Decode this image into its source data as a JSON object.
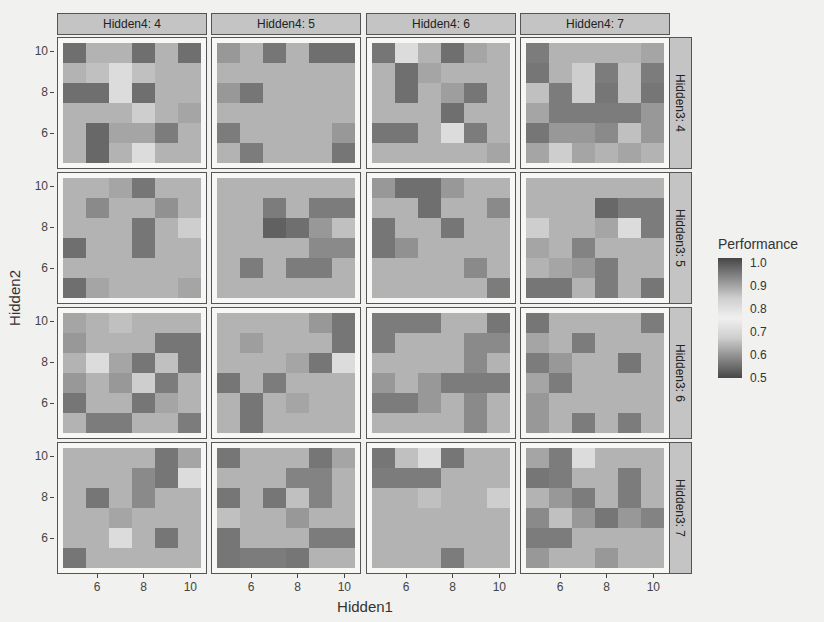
{
  "chart_data": {
    "type": "heatmap",
    "title": "",
    "xlabel": "Hidden1",
    "ylabel": "Hidden2",
    "x_values": [
      5,
      6,
      7,
      8,
      9,
      10
    ],
    "y_values_top_to_bottom": [
      10,
      9,
      8,
      7,
      6,
      5
    ],
    "x_ticks": [
      "6",
      "8",
      "10"
    ],
    "y_ticks": [
      "10",
      "8",
      "6"
    ],
    "facet_cols": {
      "variable": "Hidden4",
      "labels": [
        "Hidden4: 4",
        "Hidden4: 5",
        "Hidden4: 6",
        "Hidden4: 7"
      ]
    },
    "facet_rows": {
      "variable": "Hidden3",
      "labels": [
        "Hidden3: 4",
        "Hidden3: 5",
        "Hidden3: 6",
        "Hidden3: 7"
      ]
    },
    "legend": {
      "title": "Performance",
      "labels": [
        "1.0",
        "0.9",
        "0.8",
        "0.7",
        "0.6",
        "0.5"
      ],
      "range": [
        0.5,
        1.0
      ],
      "colormap": "diverging gray: dark at 0.5 and 1.0, light near 0.75"
    },
    "value_note": "Cell values are approximate, estimated from gray level only. Dark cells are ambiguous between the 0.5 and 1.0 ends of the scale; a mid-value was used.",
    "panels": [
      {
        "row": "Hidden3: 4",
        "col": "Hidden4: 4",
        "values": [
          [
            0.56,
            0.66,
            0.66,
            0.56,
            0.66,
            0.56
          ],
          [
            0.66,
            0.68,
            0.72,
            0.68,
            0.66,
            0.66
          ],
          [
            0.56,
            0.56,
            0.78,
            0.56,
            0.66,
            0.66
          ],
          [
            0.66,
            0.66,
            0.66,
            0.7,
            0.66,
            0.64
          ],
          [
            0.66,
            0.55,
            0.64,
            0.64,
            0.58,
            0.66
          ],
          [
            0.66,
            0.55,
            0.66,
            0.78,
            0.66,
            0.66
          ]
        ]
      },
      {
        "row": "Hidden3: 4",
        "col": "Hidden4: 5",
        "values": [
          [
            0.62,
            0.66,
            0.57,
            0.66,
            0.56,
            0.56
          ],
          [
            0.66,
            0.66,
            0.66,
            0.66,
            0.66,
            0.66
          ],
          [
            0.62,
            0.57,
            0.66,
            0.66,
            0.66,
            0.66
          ],
          [
            0.66,
            0.66,
            0.66,
            0.66,
            0.66,
            0.66
          ],
          [
            0.58,
            0.66,
            0.66,
            0.66,
            0.66,
            0.62
          ],
          [
            0.66,
            0.58,
            0.66,
            0.66,
            0.66,
            0.57
          ]
        ]
      },
      {
        "row": "Hidden3: 4",
        "col": "Hidden4: 6",
        "values": [
          [
            0.57,
            0.78,
            0.66,
            0.56,
            0.64,
            0.66
          ],
          [
            0.66,
            0.56,
            0.64,
            0.66,
            0.66,
            0.66
          ],
          [
            0.66,
            0.56,
            0.66,
            0.63,
            0.57,
            0.66
          ],
          [
            0.66,
            0.66,
            0.66,
            0.56,
            0.66,
            0.66
          ],
          [
            0.57,
            0.57,
            0.66,
            0.78,
            0.58,
            0.66
          ],
          [
            0.66,
            0.66,
            0.66,
            0.66,
            0.66,
            0.64
          ]
        ]
      },
      {
        "row": "Hidden3: 4",
        "col": "Hidden4: 7",
        "values": [
          [
            0.58,
            0.66,
            0.66,
            0.66,
            0.66,
            0.64
          ],
          [
            0.57,
            0.66,
            0.7,
            0.58,
            0.68,
            0.58
          ],
          [
            0.68,
            0.58,
            0.7,
            0.57,
            0.68,
            0.57
          ],
          [
            0.64,
            0.58,
            0.58,
            0.58,
            0.58,
            0.62
          ],
          [
            0.57,
            0.62,
            0.62,
            0.6,
            0.68,
            0.62
          ],
          [
            0.64,
            0.7,
            0.64,
            0.66,
            0.64,
            0.66
          ]
        ]
      },
      {
        "row": "Hidden3: 5",
        "col": "Hidden4: 4",
        "values": [
          [
            0.66,
            0.66,
            0.64,
            0.57,
            0.66,
            0.66
          ],
          [
            0.66,
            0.6,
            0.66,
            0.66,
            0.61,
            0.66
          ],
          [
            0.66,
            0.66,
            0.66,
            0.57,
            0.66,
            0.7
          ],
          [
            0.56,
            0.66,
            0.66,
            0.57,
            0.66,
            0.66
          ],
          [
            0.66,
            0.66,
            0.66,
            0.66,
            0.66,
            0.66
          ],
          [
            0.56,
            0.64,
            0.66,
            0.66,
            0.66,
            0.64
          ]
        ]
      },
      {
        "row": "Hidden3: 5",
        "col": "Hidden4: 5",
        "values": [
          [
            0.66,
            0.66,
            0.66,
            0.66,
            0.66,
            0.66
          ],
          [
            0.66,
            0.66,
            0.58,
            0.66,
            0.58,
            0.58
          ],
          [
            0.66,
            0.66,
            0.54,
            0.56,
            0.62,
            0.68
          ],
          [
            0.66,
            0.66,
            0.66,
            0.66,
            0.6,
            0.6
          ],
          [
            0.66,
            0.58,
            0.66,
            0.58,
            0.58,
            0.66
          ],
          [
            0.66,
            0.66,
            0.66,
            0.66,
            0.66,
            0.66
          ]
        ]
      },
      {
        "row": "Hidden3: 5",
        "col": "Hidden4: 6",
        "values": [
          [
            0.62,
            0.56,
            0.56,
            0.62,
            0.66,
            0.66
          ],
          [
            0.66,
            0.66,
            0.56,
            0.66,
            0.66,
            0.6
          ],
          [
            0.57,
            0.66,
            0.66,
            0.57,
            0.66,
            0.66
          ],
          [
            0.57,
            0.61,
            0.66,
            0.66,
            0.66,
            0.66
          ],
          [
            0.66,
            0.66,
            0.66,
            0.66,
            0.6,
            0.66
          ],
          [
            0.66,
            0.66,
            0.66,
            0.66,
            0.66,
            0.58
          ]
        ]
      },
      {
        "row": "Hidden3: 5",
        "col": "Hidden4: 7",
        "values": [
          [
            0.66,
            0.66,
            0.66,
            0.66,
            0.66,
            0.66
          ],
          [
            0.66,
            0.66,
            0.66,
            0.55,
            0.58,
            0.58
          ],
          [
            0.7,
            0.66,
            0.66,
            0.64,
            0.78,
            0.58
          ],
          [
            0.64,
            0.66,
            0.59,
            0.66,
            0.66,
            0.66
          ],
          [
            0.66,
            0.64,
            0.62,
            0.58,
            0.66,
            0.66
          ],
          [
            0.57,
            0.57,
            0.66,
            0.58,
            0.66,
            0.57
          ]
        ]
      },
      {
        "row": "Hidden3: 6",
        "col": "Hidden4: 4",
        "values": [
          [
            0.64,
            0.66,
            0.68,
            0.66,
            0.66,
            0.66
          ],
          [
            0.62,
            0.66,
            0.66,
            0.66,
            0.57,
            0.57
          ],
          [
            0.66,
            0.78,
            0.64,
            0.57,
            0.68,
            0.57
          ],
          [
            0.62,
            0.66,
            0.62,
            0.7,
            0.58,
            0.66
          ],
          [
            0.57,
            0.66,
            0.66,
            0.57,
            0.64,
            0.66
          ],
          [
            0.66,
            0.58,
            0.58,
            0.66,
            0.66,
            0.58
          ]
        ]
      },
      {
        "row": "Hidden3: 6",
        "col": "Hidden4: 5",
        "values": [
          [
            0.66,
            0.66,
            0.66,
            0.66,
            0.62,
            0.57
          ],
          [
            0.66,
            0.63,
            0.66,
            0.66,
            0.66,
            0.57
          ],
          [
            0.66,
            0.66,
            0.66,
            0.64,
            0.57,
            0.78
          ],
          [
            0.57,
            0.66,
            0.58,
            0.66,
            0.66,
            0.66
          ],
          [
            0.66,
            0.57,
            0.66,
            0.64,
            0.66,
            0.66
          ],
          [
            0.66,
            0.57,
            0.66,
            0.66,
            0.66,
            0.66
          ]
        ]
      },
      {
        "row": "Hidden3: 6",
        "col": "Hidden4: 6",
        "values": [
          [
            0.58,
            0.58,
            0.58,
            0.66,
            0.66,
            0.57
          ],
          [
            0.58,
            0.66,
            0.66,
            0.66,
            0.6,
            0.6
          ],
          [
            0.66,
            0.66,
            0.66,
            0.66,
            0.6,
            0.66
          ],
          [
            0.62,
            0.66,
            0.62,
            0.58,
            0.58,
            0.58
          ],
          [
            0.58,
            0.58,
            0.62,
            0.66,
            0.6,
            0.66
          ],
          [
            0.66,
            0.66,
            0.66,
            0.66,
            0.6,
            0.66
          ]
        ]
      },
      {
        "row": "Hidden3: 6",
        "col": "Hidden4: 7",
        "values": [
          [
            0.57,
            0.66,
            0.66,
            0.66,
            0.66,
            0.58
          ],
          [
            0.64,
            0.66,
            0.58,
            0.66,
            0.66,
            0.66
          ],
          [
            0.58,
            0.62,
            0.66,
            0.66,
            0.57,
            0.66
          ],
          [
            0.64,
            0.58,
            0.66,
            0.66,
            0.66,
            0.66
          ],
          [
            0.62,
            0.66,
            0.66,
            0.66,
            0.66,
            0.66
          ],
          [
            0.62,
            0.66,
            0.58,
            0.66,
            0.58,
            0.66
          ]
        ]
      },
      {
        "row": "Hidden3: 7",
        "col": "Hidden4: 4",
        "values": [
          [
            0.66,
            0.66,
            0.66,
            0.66,
            0.57,
            0.64
          ],
          [
            0.66,
            0.66,
            0.66,
            0.6,
            0.57,
            0.78
          ],
          [
            0.66,
            0.57,
            0.66,
            0.6,
            0.66,
            0.66
          ],
          [
            0.66,
            0.66,
            0.64,
            0.66,
            0.66,
            0.66
          ],
          [
            0.66,
            0.66,
            0.78,
            0.66,
            0.57,
            0.66
          ],
          [
            0.57,
            0.66,
            0.66,
            0.66,
            0.66,
            0.66
          ]
        ]
      },
      {
        "row": "Hidden3: 7",
        "col": "Hidden4: 5",
        "values": [
          [
            0.57,
            0.66,
            0.66,
            0.66,
            0.57,
            0.64
          ],
          [
            0.66,
            0.66,
            0.66,
            0.59,
            0.59,
            0.66
          ],
          [
            0.57,
            0.66,
            0.57,
            0.68,
            0.59,
            0.66
          ],
          [
            0.68,
            0.66,
            0.66,
            0.62,
            0.66,
            0.66
          ],
          [
            0.57,
            0.66,
            0.66,
            0.66,
            0.58,
            0.58
          ],
          [
            0.57,
            0.58,
            0.58,
            0.57,
            0.66,
            0.66
          ]
        ]
      },
      {
        "row": "Hidden3: 7",
        "col": "Hidden4: 6",
        "values": [
          [
            0.57,
            0.68,
            0.78,
            0.57,
            0.66,
            0.66
          ],
          [
            0.58,
            0.58,
            0.58,
            0.66,
            0.66,
            0.66
          ],
          [
            0.66,
            0.66,
            0.68,
            0.66,
            0.66,
            0.7
          ],
          [
            0.66,
            0.66,
            0.66,
            0.66,
            0.66,
            0.66
          ],
          [
            0.66,
            0.66,
            0.66,
            0.66,
            0.66,
            0.66
          ],
          [
            0.66,
            0.66,
            0.66,
            0.58,
            0.66,
            0.66
          ]
        ]
      },
      {
        "row": "Hidden3: 7",
        "col": "Hidden4: 7",
        "values": [
          [
            0.64,
            0.58,
            0.78,
            0.66,
            0.66,
            0.66
          ],
          [
            0.57,
            0.58,
            0.66,
            0.66,
            0.58,
            0.66
          ],
          [
            0.66,
            0.62,
            0.58,
            0.66,
            0.58,
            0.66
          ],
          [
            0.6,
            0.68,
            0.62,
            0.57,
            0.62,
            0.59
          ],
          [
            0.58,
            0.58,
            0.66,
            0.66,
            0.66,
            0.66
          ],
          [
            0.62,
            0.66,
            0.66,
            0.62,
            0.66,
            0.66
          ]
        ]
      }
    ]
  }
}
